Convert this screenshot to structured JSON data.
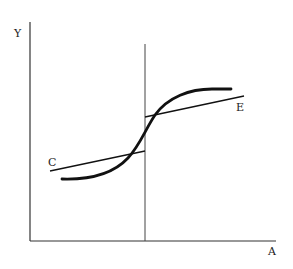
{
  "diagram": {
    "type": "line-diagram",
    "axes": {
      "y_label": "Y",
      "x_label": "A"
    },
    "curves": [
      {
        "name": "S-curve",
        "label": "",
        "style": "thick"
      },
      {
        "name": "line-C",
        "label": "C",
        "style": "thin"
      },
      {
        "name": "line-E",
        "label": "E",
        "style": "thin"
      }
    ],
    "vertical_marker": {
      "label": ""
    },
    "colors": {
      "stroke": "#111111",
      "axis": "#333333",
      "background": "#ffffff"
    }
  }
}
